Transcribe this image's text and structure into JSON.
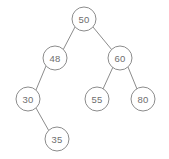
{
  "diagram": {
    "type": "binary-search-tree",
    "background_color": "#ffffff",
    "node_fill_color": "#ffffff",
    "node_stroke_color": "#8c8c8c",
    "edge_color": "#8c8c8c",
    "label_color": "#6e6e6e",
    "node_radius": 12,
    "width": 169,
    "height": 159
  },
  "nodes": [
    {
      "id": "n50",
      "label": "50",
      "value": 50,
      "cx": 84,
      "cy": 19,
      "depth": 0,
      "role": "root"
    },
    {
      "id": "n48",
      "label": "48",
      "value": 48,
      "cx": 55,
      "cy": 58,
      "depth": 1,
      "role": "left-child"
    },
    {
      "id": "n60",
      "label": "60",
      "value": 60,
      "cx": 120,
      "cy": 58,
      "depth": 1,
      "role": "right-child"
    },
    {
      "id": "n30",
      "label": "30",
      "value": 30,
      "cx": 28,
      "cy": 99,
      "depth": 2,
      "role": "left-child"
    },
    {
      "id": "n55",
      "label": "55",
      "value": 55,
      "cx": 97,
      "cy": 99,
      "depth": 2,
      "role": "left-child"
    },
    {
      "id": "n80",
      "label": "80",
      "value": 80,
      "cx": 143,
      "cy": 99,
      "depth": 2,
      "role": "right-child"
    },
    {
      "id": "n35",
      "label": "35",
      "value": 35,
      "cx": 57,
      "cy": 139,
      "depth": 3,
      "role": "right-child"
    }
  ],
  "edges": [
    {
      "id": "e50-48",
      "from": "n50",
      "to": "n48",
      "x1": 75,
      "y1": 27,
      "x2": 63,
      "y2": 50
    },
    {
      "id": "e50-60",
      "from": "n50",
      "to": "n60",
      "x1": 93,
      "y1": 27,
      "x2": 112,
      "y2": 50
    },
    {
      "id": "e48-30",
      "from": "n48",
      "to": "n30",
      "x1": 46,
      "y1": 66,
      "x2": 36,
      "y2": 90
    },
    {
      "id": "e60-55",
      "from": "n60",
      "to": "n55",
      "x1": 113,
      "y1": 67,
      "x2": 103,
      "y2": 89
    },
    {
      "id": "e60-80",
      "from": "n60",
      "to": "n80",
      "x1": 128,
      "y1": 67,
      "x2": 137,
      "y2": 89
    },
    {
      "id": "e30-35",
      "from": "n30",
      "to": "n35",
      "x1": 36,
      "y1": 108,
      "x2": 49,
      "y2": 131
    }
  ]
}
